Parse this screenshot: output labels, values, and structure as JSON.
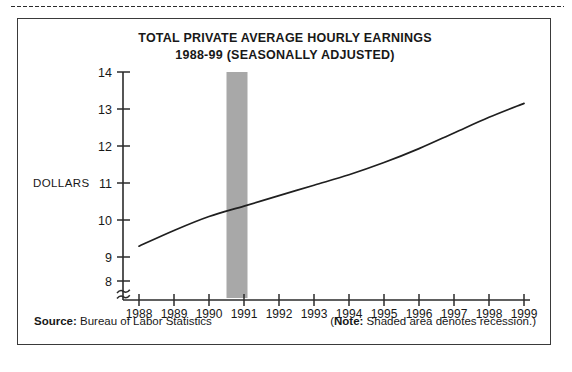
{
  "figure": {
    "title_line1": "TOTAL PRIVATE AVERAGE HOURLY EARNINGS",
    "title_line2": "1988-99 (SEASONALLY ADJUSTED)",
    "y_axis_caption": "DOLLARS",
    "source_lead": "Source:",
    "source_text": " Bureau of Labor Statistics",
    "note_open": "(",
    "note_lead": "Note:",
    "note_text": " Shaded area denotes recession.)"
  },
  "colors": {
    "line": "#1f1f1f",
    "axis": "#2b2b2b",
    "recession_band": "#a8a8a8",
    "border": "#3a3a3a",
    "background": "#ffffff"
  },
  "chart_data": {
    "type": "line",
    "title": "TOTAL PRIVATE AVERAGE HOURLY EARNINGS 1988-99 (SEASONALLY ADJUSTED)",
    "xlabel": "",
    "ylabel": "DOLLARS",
    "xlim": [
      1988,
      1999
    ],
    "ylim": [
      8,
      14
    ],
    "y_ticks": [
      8,
      9,
      10,
      11,
      12,
      13,
      14
    ],
    "x_ticks": [
      1988,
      1989,
      1990,
      1991,
      1992,
      1993,
      1994,
      1995,
      1996,
      1997,
      1998,
      1999
    ],
    "y_axis_break": true,
    "y_axis_break_symbol": "≈",
    "grid": false,
    "legend": "none",
    "x": [
      1988,
      1989,
      1990,
      1991,
      1992,
      1993,
      1994,
      1995,
      1996,
      1997,
      1998,
      1999
    ],
    "series": [
      {
        "name": "Total private average hourly earnings",
        "values": [
          9.0,
          9.45,
          9.85,
          10.15,
          10.45,
          10.75,
          11.05,
          11.4,
          11.8,
          12.25,
          12.7,
          13.1
        ]
      }
    ],
    "annotations": [
      {
        "type": "shaded-band",
        "label": "recession",
        "x_start": 1990.5,
        "x_end": 1991.1,
        "color": "#a8a8a8"
      }
    ],
    "source": "Bureau of Labor Statistics",
    "note": "Shaded area denotes recession."
  }
}
